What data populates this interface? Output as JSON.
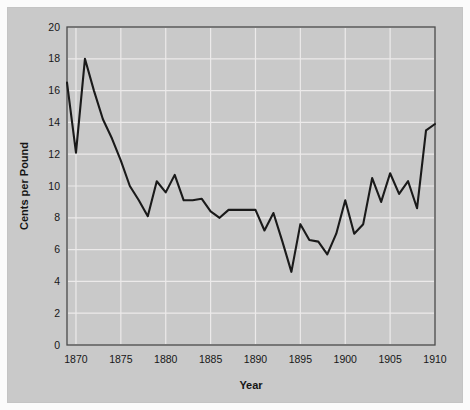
{
  "figure": {
    "background_color": "#c9c9c9",
    "page_background_color": "#fbfbfb",
    "plot_frame_color": "#4a4a4a",
    "grid_color": "#eceaea",
    "line_color": "#1a1a1a"
  },
  "axes": {
    "x_title": "Year",
    "y_title": "Cents per Pound",
    "x_ticks": [
      "1870",
      "1875",
      "1880",
      "1885",
      "1890",
      "1895",
      "1900",
      "1905",
      "1910"
    ],
    "y_ticks": [
      "0",
      "2",
      "4",
      "6",
      "8",
      "10",
      "12",
      "14",
      "16",
      "18",
      "20"
    ]
  },
  "chart_data": {
    "type": "line",
    "title": "",
    "xlabel": "Year",
    "ylabel": "Cents per Pound",
    "xlim": [
      1869,
      1910
    ],
    "ylim": [
      0,
      20
    ],
    "xtick_values": [
      1870,
      1875,
      1880,
      1885,
      1890,
      1895,
      1900,
      1905,
      1910
    ],
    "ytick_values": [
      0,
      2,
      4,
      6,
      8,
      10,
      12,
      14,
      16,
      18,
      20
    ],
    "grid": true,
    "legend": "none",
    "series": [
      {
        "name": "Cotton price",
        "x": [
          1869,
          1870,
          1871,
          1872,
          1873,
          1874,
          1875,
          1876,
          1877,
          1878,
          1879,
          1880,
          1881,
          1882,
          1883,
          1884,
          1885,
          1886,
          1887,
          1888,
          1889,
          1890,
          1891,
          1892,
          1893,
          1894,
          1895,
          1896,
          1897,
          1898,
          1899,
          1900,
          1901,
          1902,
          1903,
          1904,
          1905,
          1906,
          1907,
          1908,
          1909,
          1910
        ],
        "values": [
          16.5,
          12.1,
          18.0,
          16.0,
          14.2,
          13.0,
          11.6,
          10.0,
          9.1,
          8.1,
          10.3,
          9.6,
          10.7,
          9.1,
          9.1,
          9.2,
          8.4,
          8.0,
          8.5,
          8.5,
          8.5,
          8.5,
          7.2,
          8.3,
          6.5,
          4.6,
          7.6,
          6.6,
          6.5,
          5.7,
          7.0,
          9.1,
          7.0,
          7.6,
          10.5,
          9.0,
          10.8,
          9.5,
          10.3,
          8.6,
          13.5,
          13.9
        ]
      }
    ]
  }
}
